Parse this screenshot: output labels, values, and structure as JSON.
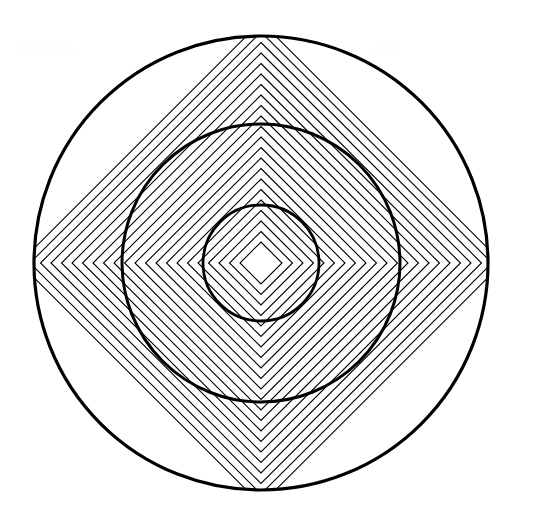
{
  "figure": {
    "title": "Concentric circles with nested diamond hatch pattern",
    "background_color": "#ffffff",
    "stroke_color": "#000000",
    "width": 533,
    "height": 508,
    "center": {
      "x": 261,
      "y": 263
    },
    "circles": [
      {
        "name": "outer-circle",
        "radius": 227,
        "stroke_width": 3.2
      },
      {
        "name": "middle-circle",
        "radius": 139,
        "stroke_width": 3.0
      },
      {
        "name": "inner-circle",
        "radius": 58,
        "stroke_width": 2.8
      }
    ],
    "diamonds": {
      "name": "concentric-diamonds",
      "count": 22,
      "spacing": 10.5,
      "innermost_radius": 21,
      "stroke_width": 1.1,
      "rotation_deg": 45,
      "clipped_to": "outer-circle"
    }
  },
  "watermarks": [
    {
      "text": "Pattern",
      "x": 16,
      "y": 40
    },
    {
      "text": "Fig",
      "x": 374,
      "y": 40
    }
  ],
  "chart_data": {
    "type": "scatter",
    "title": "Concentric circles with nested diamond hatch pattern",
    "xlabel": "",
    "ylabel": "",
    "xlim": [
      0,
      533
    ],
    "ylim": [
      0,
      508
    ],
    "grid": false,
    "legend": "none",
    "series": [
      {
        "name": "circles",
        "shape": "circle",
        "center": [
          261,
          263
        ],
        "values": [
          227,
          139,
          58
        ]
      },
      {
        "name": "diamonds",
        "shape": "square-rotated-45",
        "center": [
          261,
          263
        ],
        "values": [
          21,
          31.5,
          42,
          52.5,
          63,
          73.5,
          84,
          94.5,
          105,
          115.5,
          126,
          136.5,
          147,
          157.5,
          168,
          178.5,
          189,
          199.5,
          210,
          220.5,
          231,
          241.5
        ]
      }
    ]
  }
}
